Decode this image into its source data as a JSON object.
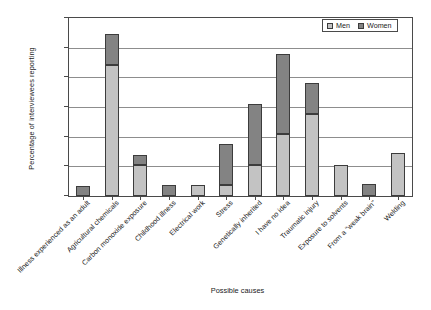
{
  "chart_data": {
    "type": "bar",
    "subtype": "stacked-bar",
    "title": "",
    "xlabel": "Possible causes",
    "ylabel": "Percentage of interviewees reporting",
    "ylim": [
      0,
      30
    ],
    "yticks": [
      0,
      5,
      10,
      15,
      20,
      25,
      30
    ],
    "grid": true,
    "legend_position": "top-right",
    "categories": [
      "Illness experienced as an adult",
      "Agricultural chemicals",
      "Carbon monoxide exposure",
      "Childhood illness",
      "Electrical work",
      "Stress",
      "Genetically inherited",
      "I have no idea",
      "Traumatic injury",
      "Exposure to solvents",
      "From a \"weak brain\"",
      "Welding"
    ],
    "series": [
      {
        "name": "Men",
        "color": "#c3c3c3",
        "values": [
          0,
          22.0,
          5.2,
          0,
          1.9,
          1.8,
          5.2,
          10.5,
          13.8,
          5.3,
          0,
          7.2
        ]
      },
      {
        "name": "Women",
        "color": "#838383",
        "values": [
          1.7,
          5.3,
          1.7,
          1.8,
          0,
          6.9,
          10.3,
          13.5,
          5.2,
          0,
          2.0,
          0
        ]
      }
    ],
    "totals": [
      1.7,
      27.3,
      6.9,
      1.8,
      1.9,
      8.7,
      15.5,
      24.0,
      19.0,
      5.3,
      2.0,
      7.2
    ]
  },
  "legend": {
    "items": [
      {
        "label": "Men",
        "color": "#c3c3c3"
      },
      {
        "label": "Women",
        "color": "#838383"
      }
    ]
  },
  "axes": {
    "y_title": "Percentage of interviewees reporting",
    "x_title": "Possible causes",
    "y_tick_labels": [
      "0",
      "5",
      "10",
      "15",
      "20",
      "25",
      "30"
    ]
  }
}
